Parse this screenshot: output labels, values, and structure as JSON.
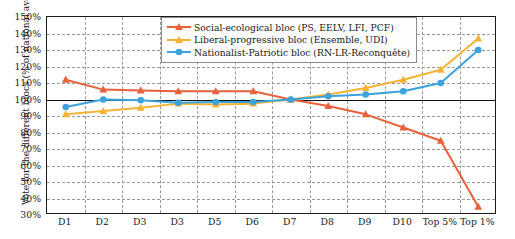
{
  "chart_data": {
    "type": "line",
    "title": "",
    "xlabel": "",
    "ylabel": "Vote for the different blocs (% of national average)",
    "categories": [
      "D1",
      "D2",
      "D3",
      "D3",
      "D5",
      "D6",
      "D7",
      "D8",
      "D9",
      "D10",
      "Top 5%",
      "Top 1%"
    ],
    "ylim": [
      30,
      150
    ],
    "ytick_values": [
      30,
      40,
      50,
      60,
      70,
      80,
      90,
      100,
      110,
      120,
      130,
      140,
      150
    ],
    "ytick_labels": [
      "30%",
      "40%",
      "50%",
      "60%",
      "70%",
      "80%",
      "90%",
      "100%",
      "110%",
      "120%",
      "130%",
      "140%",
      "150%"
    ],
    "grid": true,
    "reference_line": 100,
    "legend_position": "top-center",
    "series": [
      {
        "name": "Social-ecological bloc (PS, EELV, LFI, PCF)",
        "color": "#E8613C",
        "marker": "triangle",
        "values": [
          112,
          106,
          105.5,
          105,
          105,
          105,
          100,
          96,
          91,
          83,
          75,
          35
        ]
      },
      {
        "name": "Liberal-progressive bloc (Ensemble, UDI)",
        "color": "#F5B335",
        "marker": "triangle",
        "values": [
          91,
          93,
          95,
          97.5,
          97,
          97.5,
          100,
          103,
          107,
          112,
          118,
          137
        ]
      },
      {
        "name": "Nationalist-Patriotic bloc (RN-LR-Reconquête)",
        "color": "#3BA3DB",
        "marker": "circle",
        "values": [
          95.5,
          100,
          99.5,
          98,
          98.5,
          98.5,
          100,
          102,
          103,
          105,
          110,
          130
        ]
      }
    ]
  }
}
